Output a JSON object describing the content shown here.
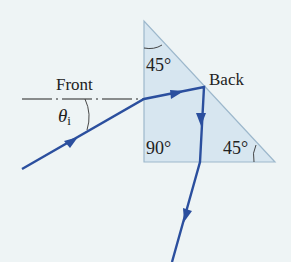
{
  "figure": {
    "type": "ray-diagram",
    "colors": {
      "background": "#eef4f5",
      "prism_fill": "#d7e6f0",
      "prism_edge": "#9db8cc",
      "ray": "#2b4f9e",
      "normal_line": "#222222",
      "text": "#222222"
    }
  },
  "labels": {
    "front": "Front",
    "back": "Back",
    "theta": "θ",
    "theta_sub": "i",
    "apex_angle": "45°",
    "right_angle": "90°",
    "base_angle": "45°"
  },
  "geometry": {
    "prism": {
      "apex": [
        144,
        21
      ],
      "bottom_left": [
        144,
        162
      ],
      "bottom_right": [
        275,
        162
      ]
    },
    "ray_path": [
      [
        22,
        169
      ],
      [
        144,
        99
      ],
      [
        204,
        87
      ],
      [
        200,
        162
      ],
      [
        172,
        262
      ]
    ],
    "normal_line": {
      "from": [
        22,
        99
      ],
      "to": [
        144,
        99
      ]
    }
  }
}
